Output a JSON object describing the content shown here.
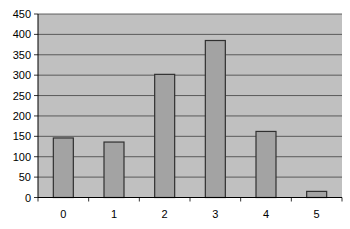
{
  "chart_data": {
    "type": "bar",
    "title": "",
    "xlabel": "",
    "ylabel": "",
    "categories": [
      "0",
      "1",
      "2",
      "3",
      "4",
      "5"
    ],
    "values": [
      146,
      136,
      302,
      385,
      162,
      15
    ],
    "ylim": [
      0,
      450
    ],
    "yticks": [
      0,
      50,
      100,
      150,
      200,
      250,
      300,
      350,
      400,
      450
    ],
    "grid": true,
    "legend": null,
    "colors": {
      "plot_background": "#c0c0c0",
      "bar_fill": "#a3a3a3",
      "bar_border": "#303030",
      "gridline": "#404040"
    }
  }
}
